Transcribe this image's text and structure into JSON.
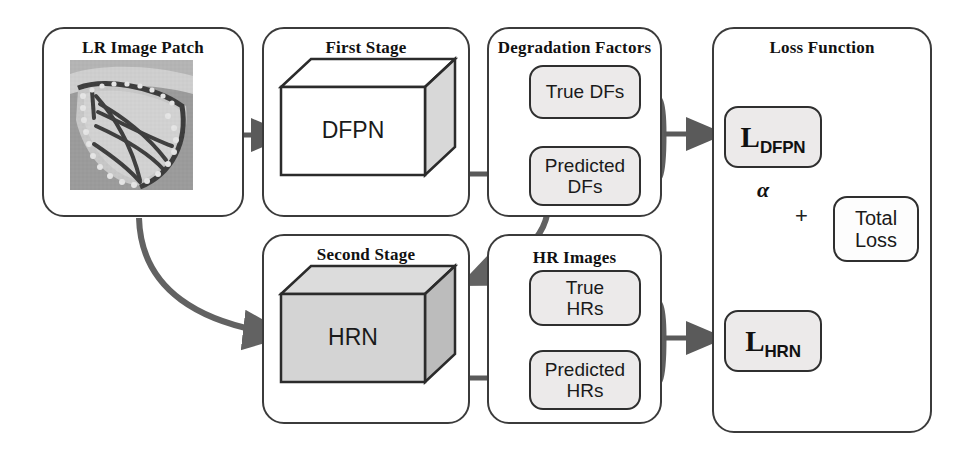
{
  "panels": {
    "lr": {
      "title": "LR Image Patch"
    },
    "first_stage": {
      "title": "First Stage",
      "block_label": "DFPN"
    },
    "degradation": {
      "title": "Degradation Factors",
      "true_label": "True DFs",
      "predicted_label": "Predicted\nDFs"
    },
    "loss": {
      "title": "Loss Function",
      "dfpn_loss_main": "L",
      "dfpn_loss_sub": "DFPN",
      "hrn_loss_main": "L",
      "hrn_loss_sub": "HRN",
      "total_loss_label": "Total\nLoss",
      "alpha_symbol": "α",
      "plus_symbol": "+"
    },
    "second_stage": {
      "title": "Second Stage",
      "block_label": "HRN"
    },
    "hr_images": {
      "title": "HR Images",
      "true_label": "True\nHRs",
      "predicted_label": "Predicted\nHRs"
    }
  },
  "colors": {
    "panel_border": "#3b3b3b",
    "box_border": "#2f2f2f",
    "box_fill": "#eceaea",
    "arrow": "#5a5a5a",
    "connector": "#5e5e5e",
    "cuboid_white_face": "#ffffff",
    "cuboid_shade_face": "#d8d8d8",
    "cuboid_gray_face": "#d5d5d5",
    "cuboid_gray_shade": "#bcbcbc",
    "text": "#111111"
  },
  "image_patch": {
    "alt": "Low resolution grayscale photo of a monarch butterfly wing"
  }
}
